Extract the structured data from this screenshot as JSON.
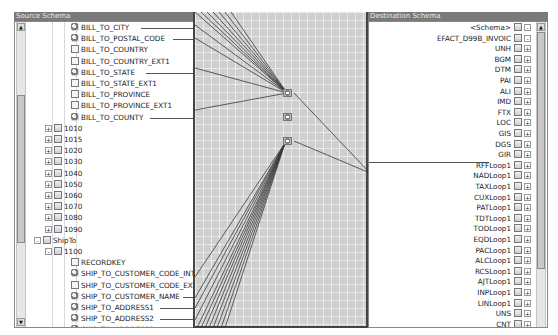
{
  "source_panel": {
    "title": "Source Schema",
    "rows": [
      {
        "label": "BILL_TO_CITY",
        "icon": "mapped-field-icon",
        "mapped": true
      },
      {
        "label": "BILL_TO_POSTAL_CODE",
        "icon": "mapped-field-icon",
        "mapped": true
      },
      {
        "label": "BILL_TO_COUNTRY",
        "icon": "field-icon",
        "mapped": false
      },
      {
        "label": "BILL_TO_COUNTRY_EXT1",
        "icon": "field-icon",
        "mapped": false
      },
      {
        "label": "BILL_TO_STATE",
        "icon": "mapped-field-icon",
        "mapped": true
      },
      {
        "label": "BILL_TO_STATE_EXT1",
        "icon": "field-icon",
        "mapped": false
      },
      {
        "label": "BILL_TO_PROVINCE",
        "icon": "field-icon",
        "mapped": false
      },
      {
        "label": "BILL_TO_PROVINCE_EXT1",
        "icon": "field-icon",
        "mapped": false
      },
      {
        "label": "BILL_TO_COUNTY",
        "icon": "mapped-field-icon",
        "mapped": true
      },
      {
        "label": "1010",
        "icon": "folder-icon",
        "expander": "+"
      },
      {
        "label": "1015",
        "icon": "folder-icon",
        "expander": "+"
      },
      {
        "label": "1020",
        "icon": "folder-icon",
        "expander": "+"
      },
      {
        "label": "1030",
        "icon": "folder-icon",
        "expander": "+"
      },
      {
        "label": "1040",
        "icon": "folder-icon",
        "expander": "+"
      },
      {
        "label": "1050",
        "icon": "folder-icon",
        "expander": "+"
      },
      {
        "label": "1060",
        "icon": "folder-icon",
        "expander": "+"
      },
      {
        "label": "1070",
        "icon": "folder-icon",
        "expander": "+"
      },
      {
        "label": "1080",
        "icon": "folder-icon",
        "expander": "+"
      },
      {
        "label": "1090",
        "icon": "folder-icon",
        "expander": "+"
      },
      {
        "label": "ShipTo",
        "icon": "folder-icon",
        "expander": "-"
      },
      {
        "label": "1100",
        "icon": "folder-icon",
        "expander": "-"
      },
      {
        "label": "RECORDKEY",
        "icon": "field-icon",
        "mapped": false
      },
      {
        "label": "SHIP_TO_CUSTOMER_CODE_INT",
        "icon": "mapped-field-icon",
        "mapped": true
      },
      {
        "label": "SHIP_TO_CUSTOMER_CODE_EXT",
        "icon": "field-icon",
        "mapped": false
      },
      {
        "label": "SHIP_TO_CUSTOMER_NAME",
        "icon": "mapped-field-icon",
        "mapped": true
      },
      {
        "label": "SHIP_TO_ADDRESS1",
        "icon": "mapped-field-icon",
        "mapped": true
      },
      {
        "label": "SHIP_TO_ADDRESS2",
        "icon": "mapped-field-icon",
        "mapped": true
      },
      {
        "label": "SHIP_TO_ADDRESS3",
        "icon": "mapped-field-icon",
        "mapped": true
      },
      {
        "label": "SHIP_TO_ADDRESS4",
        "icon": "field-icon",
        "mapped": false
      }
    ]
  },
  "destination_panel": {
    "title": "Destination Schema",
    "rows": [
      {
        "label": "<Schema>",
        "expander": "-"
      },
      {
        "label": "EFACT_D99B_INVOIC",
        "expander": "-"
      },
      {
        "label": "UNH",
        "expander": "+"
      },
      {
        "label": "BGM",
        "expander": "+"
      },
      {
        "label": "DTM",
        "expander": "+"
      },
      {
        "label": "PAI",
        "expander": "+"
      },
      {
        "label": "ALI",
        "expander": "+"
      },
      {
        "label": "IMD",
        "expander": "+"
      },
      {
        "label": "FTX",
        "expander": "+"
      },
      {
        "label": "LOC",
        "expander": "+"
      },
      {
        "label": "GIS",
        "expander": "+"
      },
      {
        "label": "DGS",
        "expander": "+"
      },
      {
        "label": "GIR",
        "expander": "+"
      },
      {
        "label": "RFFLoop1",
        "expander": "+"
      },
      {
        "label": "NADLoop1",
        "expander": "+",
        "mapped": true
      },
      {
        "label": "TAXLoop1",
        "expander": "+"
      },
      {
        "label": "CUXLoop1",
        "expander": "+"
      },
      {
        "label": "PATLoop1",
        "expander": "+"
      },
      {
        "label": "TDTLoop1",
        "expander": "+"
      },
      {
        "label": "TODLoop1",
        "expander": "+"
      },
      {
        "label": "EQDLoop1",
        "expander": "+"
      },
      {
        "label": "PACLoop1",
        "expander": "+"
      },
      {
        "label": "ALCLoop1",
        "expander": "+"
      },
      {
        "label": "RCSLoop1",
        "expander": "+"
      },
      {
        "label": "AJTLoop1",
        "expander": "+"
      },
      {
        "label": "INPLoop1",
        "expander": "+"
      },
      {
        "label": "LINLoop1",
        "expander": "+"
      },
      {
        "label": "UNS",
        "expander": "+"
      },
      {
        "label": "CNT",
        "expander": "+"
      }
    ]
  },
  "mapping_canvas": {
    "functoids": [
      {
        "name": "functoid-1",
        "x": 88,
        "y": 90
      },
      {
        "name": "functoid-2",
        "x": 88,
        "y": 113
      },
      {
        "name": "functoid-3",
        "x": 88,
        "y": 138
      }
    ],
    "colors": {
      "background": "#cfcfcf",
      "link": "#3a3a3a"
    }
  },
  "scroll_arrows": {
    "up": "▲",
    "down": "▼"
  }
}
